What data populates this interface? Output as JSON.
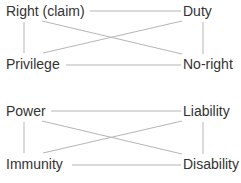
{
  "colors": {
    "text": "#333333",
    "line": "#b5b5b5",
    "background": "#ffffff"
  },
  "diagrams": [
    {
      "name": "first-order",
      "top_left": "Right (claim)",
      "top_right": "Duty",
      "bottom_left": "Privilege",
      "bottom_right": "No-right"
    },
    {
      "name": "second-order",
      "top_left": "Power",
      "top_right": "Liability",
      "bottom_left": "Immunity",
      "bottom_right": "Disability"
    }
  ]
}
